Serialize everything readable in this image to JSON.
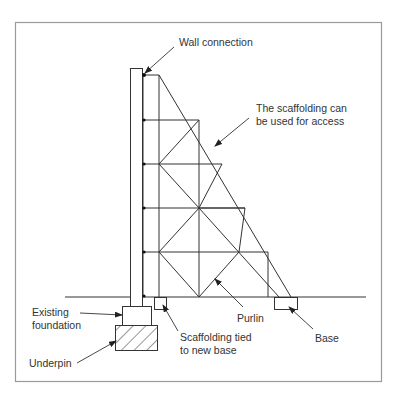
{
  "diagram": {
    "frame_color": "#9a9a9a",
    "line_color": "#333333",
    "labels": {
      "wall_connection": "Wall connection",
      "access_line1": "The scaffolding can",
      "access_line2": "be used for access",
      "existing_line1": "Existing",
      "existing_line2": "foundation",
      "underpin": "Underpin",
      "tied_line1": "Scaffolding tied",
      "tied_line2": "to new base",
      "purlin": "Purlin",
      "base": "Base"
    }
  }
}
